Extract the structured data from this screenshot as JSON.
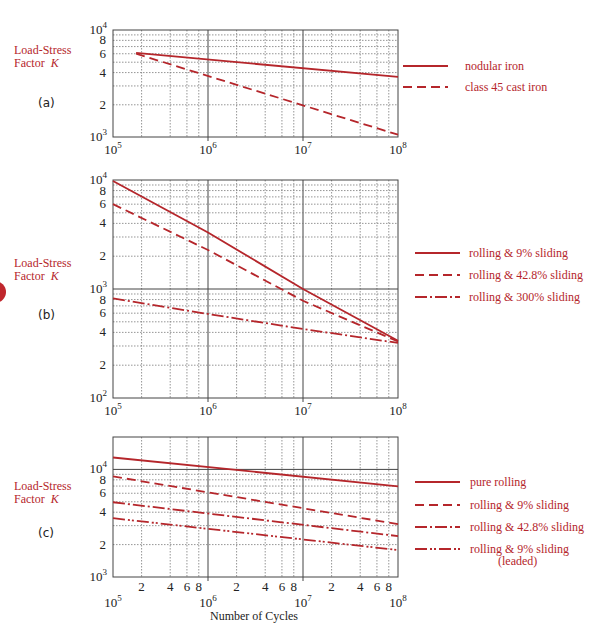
{
  "colors": {
    "line": "#b5262b",
    "grid": "#7a7a7a",
    "axis": "#444444",
    "label": "#b5262b"
  },
  "y_axis_label": {
    "text": "Load-Stress",
    "text2": "Factor",
    "symbol": "K"
  },
  "x_axis_label": "Number of Cycles",
  "panels": [
    {
      "label": "(a)"
    },
    {
      "label": "(b)"
    },
    {
      "label": "(c)"
    }
  ],
  "chart_data": [
    {
      "type": "line",
      "panel": "(a)",
      "xscale": "log",
      "yscale": "log",
      "xlim": [
        100000,
        100000000
      ],
      "ylim": [
        1000,
        10000
      ],
      "xticks": [
        "10^5",
        "10^6",
        "10^7",
        "10^8"
      ],
      "yticks": [
        "10^3",
        "2",
        "4",
        "6",
        "8",
        "10^4"
      ],
      "xlabel": "",
      "ylabel": "Load-Stress Factor K",
      "grid": true,
      "legend_position": "right",
      "series": [
        {
          "name": "nodular iron",
          "style": "solid",
          "x": [
            175000,
            100000000
          ],
          "y": [
            6100,
            3640
          ]
        },
        {
          "name": "class 45 cast iron",
          "style": "dashed",
          "x": [
            175000,
            100000000
          ],
          "y": [
            6000,
            1050
          ]
        }
      ]
    },
    {
      "type": "line",
      "panel": "(b)",
      "xscale": "log",
      "yscale": "log",
      "xlim": [
        100000,
        100000000
      ],
      "ylim": [
        100,
        10000
      ],
      "xticks": [
        "10^5",
        "10^6",
        "10^7",
        "10^8"
      ],
      "yticks": [
        "10^3",
        "2",
        "4",
        "6",
        "8",
        "10^3",
        "2",
        "4",
        "6",
        "8",
        "10^4"
      ],
      "xlabel": "",
      "ylabel": "Load-Stress Factor K",
      "grid": true,
      "legend_position": "right",
      "series": [
        {
          "name": "rolling & 9% sliding",
          "style": "solid",
          "x": [
            100000,
            1000000,
            10000000,
            100000000
          ],
          "y": [
            9800,
            3300,
            1000,
            335
          ]
        },
        {
          "name": "rolling & 42.8% sliding",
          "style": "dashed",
          "x": [
            100000,
            1000000,
            10000000,
            100000000
          ],
          "y": [
            6000,
            2280,
            780,
            330
          ]
        },
        {
          "name": "rolling & 300% sliding",
          "style": "dashdot",
          "x": [
            100000,
            1000000,
            10000000,
            100000000
          ],
          "y": [
            820,
            590,
            430,
            320
          ]
        }
      ]
    },
    {
      "type": "line",
      "panel": "(c)",
      "xscale": "log",
      "yscale": "log",
      "xlim": [
        100000,
        100000000
      ],
      "ylim": [
        1000,
        20000
      ],
      "xticks": [
        "10^5",
        "2",
        "4",
        "6",
        "8",
        "10^6",
        "2",
        "4",
        "6",
        "8",
        "10^7",
        "2",
        "4",
        "6",
        "8",
        "10^8"
      ],
      "yticks": [
        "10^3",
        "2",
        "4",
        "6",
        "8",
        "10^4",
        "2"
      ],
      "xlabel": "Number of Cycles",
      "ylabel": "Load-Stress Factor K",
      "grid": true,
      "legend_position": "right",
      "series": [
        {
          "name": "pure rolling",
          "style": "solid",
          "x": [
            100000,
            100000000
          ],
          "y": [
            12900,
            6960
          ]
        },
        {
          "name": "rolling & 9% sliding",
          "style": "dashed",
          "x": [
            100000,
            100000000
          ],
          "y": [
            8600,
            3100
          ]
        },
        {
          "name": "rolling & 42.8% sliding",
          "style": "dashdot",
          "x": [
            100000,
            100000000
          ],
          "y": [
            4950,
            2400
          ]
        },
        {
          "name": "rolling & 9% sliding (leaded)",
          "style": "dashdotdot",
          "x": [
            100000,
            100000000
          ],
          "y": [
            3520,
            1780
          ]
        }
      ]
    }
  ],
  "legends": {
    "a": [
      "nodular iron",
      "class 45 cast iron"
    ],
    "b": [
      "rolling & 9% sliding",
      "rolling & 42.8% sliding",
      "rolling & 300% sliding"
    ],
    "c": [
      "pure rolling",
      "rolling & 9% sliding",
      "rolling & 42.8% sliding",
      "rolling & 9% sliding",
      "(leaded)"
    ]
  }
}
